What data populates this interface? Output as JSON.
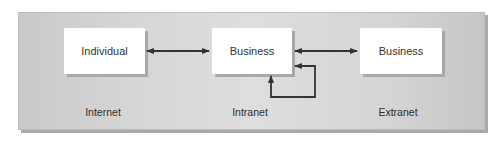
{
  "diagram": {
    "nodes": [
      {
        "id": "individual",
        "label": "Individual"
      },
      {
        "id": "business-middle",
        "label": "Business"
      },
      {
        "id": "business-right",
        "label": "Business"
      }
    ],
    "zones": [
      {
        "id": "internet",
        "label": "Internet"
      },
      {
        "id": "intranet",
        "label": "Intranet"
      },
      {
        "id": "extranet",
        "label": "Extranet"
      }
    ],
    "edges": [
      {
        "from": "individual",
        "to": "business-middle",
        "type": "bidirectional"
      },
      {
        "from": "business-middle",
        "to": "business-right",
        "type": "bidirectional"
      },
      {
        "from": "business-middle",
        "to": "business-middle",
        "type": "self-loop"
      }
    ],
    "colors": {
      "panel": "#d6d6d6",
      "box": "#ffffff",
      "arrow": "#333333"
    }
  }
}
